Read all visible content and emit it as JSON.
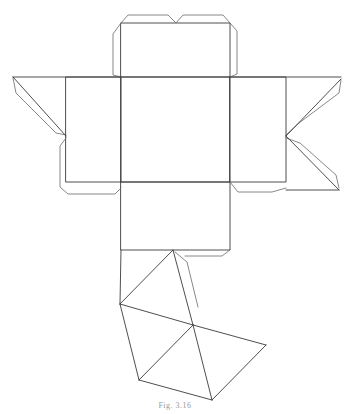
{
  "figure": {
    "caption": "Fig. 3.16"
  },
  "style": {
    "stroke_main": "#3a3a3a",
    "stroke_tab": "#6a6a6a",
    "background": "#ffffff"
  },
  "panels": [
    {
      "id": "top-tab-panel",
      "points": "121,23 230,23 230,77 121,77"
    },
    {
      "id": "top-panel",
      "points": "121,77 230,77 230,182 121,182"
    },
    {
      "id": "left-panel",
      "points": "66,77 121,77 121,182 66,182"
    },
    {
      "id": "right-panel",
      "points": "230,77 286,77 286,182 230,182"
    },
    {
      "id": "front-panel",
      "points": "121,182 230,182 230,250 121,250"
    }
  ],
  "tabs": [
    {
      "id": "top-lid-tab",
      "points": "121,23 128,15 168,15 176,23 183,15 223,15 230,23"
    },
    {
      "id": "top-left-side-tab",
      "points": "121,23 113,34 113,75 121,77"
    },
    {
      "id": "top-right-side-tab",
      "points": "230,23 237,31 237,74 230,77"
    },
    {
      "id": "left-flap-upper",
      "points": "13,78 16,93 56,133 66,135"
    },
    {
      "id": "left-flap-lower",
      "points": "66,138 60,146 60,187 68,194 115,194 121,188"
    },
    {
      "id": "right-flap-upper",
      "points": "286,135 299,123 339,93 341,80"
    },
    {
      "id": "right-flap-lower",
      "points": "286,138 300,143 336,175 339,188"
    },
    {
      "id": "right-bottom-tab",
      "points": "230,182 238,192 272,192 286,188"
    },
    {
      "id": "front-bottom-tab",
      "points": "230,250 222,256 185,256"
    },
    {
      "id": "pyramid-side-tab",
      "points": "175,252 187,262 198,307"
    }
  ],
  "lines": [
    {
      "id": "left-panel-top",
      "x1": 13,
      "y1": 77,
      "x2": 121,
      "y2": 77
    },
    {
      "id": "right-panel-top",
      "x1": 230,
      "y1": 77,
      "x2": 341,
      "y2": 77
    },
    {
      "id": "left-triangle-diag",
      "x1": 13,
      "y1": 77,
      "x2": 66,
      "y2": 136
    },
    {
      "id": "right-triangle-diag-upper",
      "x1": 341,
      "y1": 79,
      "x2": 286,
      "y2": 136
    },
    {
      "id": "right-triangle-diag-lower",
      "x1": 286,
      "y1": 136,
      "x2": 339,
      "y2": 190
    },
    {
      "id": "right-bottom-edge",
      "x1": 286,
      "y1": 190,
      "x2": 339,
      "y2": 190
    },
    {
      "id": "pyr-apex-left",
      "x1": 173,
      "y1": 250,
      "x2": 120,
      "y2": 304
    },
    {
      "id": "pyr-apex-center",
      "x1": 173,
      "y1": 250,
      "x2": 193,
      "y2": 325
    },
    {
      "id": "pyr-left-vertical",
      "x1": 121,
      "y1": 250,
      "x2": 120,
      "y2": 304
    },
    {
      "id": "pyr-left-center",
      "x1": 120,
      "y1": 304,
      "x2": 193,
      "y2": 325
    },
    {
      "id": "pyr-center-right",
      "x1": 193,
      "y1": 325,
      "x2": 266,
      "y2": 345
    },
    {
      "id": "pyr-right-bottom",
      "x1": 266,
      "y1": 345,
      "x2": 212,
      "y2": 400
    },
    {
      "id": "pyr-center-bottom",
      "x1": 193,
      "y1": 325,
      "x2": 212,
      "y2": 400
    },
    {
      "id": "pyr-center-bottomleft",
      "x1": 193,
      "y1": 325,
      "x2": 139,
      "y2": 380
    },
    {
      "id": "pyr-left-bottomleft",
      "x1": 120,
      "y1": 304,
      "x2": 139,
      "y2": 380
    },
    {
      "id": "pyr-bottomleft-bottom",
      "x1": 139,
      "y1": 380,
      "x2": 212,
      "y2": 400
    }
  ]
}
